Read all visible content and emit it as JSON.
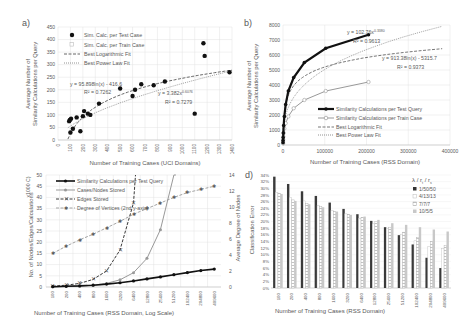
{
  "chart_data": [
    {
      "panel": "a)",
      "type": "scatter",
      "title": "",
      "xlabel": "Number of Training Cases (UCI Domains)",
      "ylabel": "Average Number of Similarity Calculations per Query",
      "xlim": [
        0,
        1400
      ],
      "ylim": [
        0,
        450
      ],
      "x_ticks": [
        "0",
        "100",
        "200",
        "300",
        "400",
        "500",
        "600",
        "700",
        "800",
        "900",
        "1000",
        "1100",
        "1200",
        "1300",
        "1400"
      ],
      "y_ticks": [
        "0",
        "50",
        "100",
        "150",
        "200",
        "250",
        "300",
        "350",
        "400",
        "450"
      ],
      "grid": true,
      "legend": [
        "Sim. Calc. per Test Case",
        "Sim. Calc. per Train Case",
        "Best Logarithmic Fit",
        "Best Power Law Fit"
      ],
      "legend_position": "upper-left",
      "series": [
        {
          "name": "Sim. Calc. per Test Case",
          "points": [
            [
              90,
              75
            ],
            [
              95,
              80
            ],
            [
              105,
              85
            ],
            [
              100,
              30
            ],
            [
              120,
              45
            ],
            [
              150,
              90
            ],
            [
              180,
              35
            ],
            [
              200,
              95
            ],
            [
              210,
              115
            ],
            [
              240,
              105
            ],
            [
              260,
              100
            ],
            [
              330,
              145
            ],
            [
              500,
              205
            ],
            [
              600,
              175
            ],
            [
              620,
              200
            ],
            [
              670,
              222
            ],
            [
              770,
              218
            ],
            [
              860,
              233
            ],
            [
              1100,
              105
            ],
            [
              1170,
              385
            ],
            [
              1180,
              335
            ],
            [
              1380,
              270
            ]
          ]
        },
        {
          "name": "Sim. Calc. per Train Case",
          "points": [
            [
              90,
              72
            ],
            [
              100,
              28
            ],
            [
              110,
              40
            ],
            [
              150,
              88
            ],
            [
              200,
              92
            ]
          ]
        }
      ],
      "fits": [
        {
          "name": "Best Logarithmic Fit",
          "equation": "y = 95.898ln(x) - 416.6",
          "r2": "R² = 0.7262"
        },
        {
          "name": "Best Power Law Fit",
          "equation": "y = 3.382x^0.6076",
          "r2": "R² = 0.7279"
        }
      ]
    },
    {
      "panel": "b)",
      "type": "line",
      "xlabel": "Number of Training Cases (RSS Domain)",
      "ylabel": "Average Number of Similarity Calculations per Query",
      "xlim": [
        0,
        400000
      ],
      "ylim": [
        0,
        8000
      ],
      "x_ticks": [
        "0",
        "100000",
        "200000",
        "300000",
        "400000"
      ],
      "y_ticks": [
        "0",
        "1000",
        "2000",
        "3000",
        "4000",
        "5000",
        "6000",
        "7000",
        "8000"
      ],
      "grid": true,
      "legend": [
        "Similarity Calculations per Test Query",
        "Similarity Calculations per Train Case",
        "Best Logarithmic Fit",
        "Best Power Law Fit"
      ],
      "legend_position": "lower-right",
      "x": [
        100,
        200,
        400,
        800,
        1600,
        3200,
        6400,
        12800,
        25600,
        51200,
        102400,
        204800,
        409600
      ],
      "series": [
        {
          "name": "Similarity Calculations per Test Query",
          "values": [
            150,
            300,
            500,
            800,
            1300,
            1900,
            2700,
            3600,
            4500,
            5500,
            6450,
            7350,
            7350
          ]
        },
        {
          "name": "Similarity Calculations per Train Case",
          "values": [
            100,
            200,
            350,
            550,
            800,
            1100,
            1450,
            1900,
            2450,
            3000,
            3600,
            4200,
            4200
          ]
        }
      ],
      "fits": [
        {
          "name": "Best Power Law Fit",
          "equation": "y = 102.76x^0.3380",
          "r2": "R² = 0.9613"
        },
        {
          "name": "Best Logarithmic Fit",
          "equation": "y = 913.38ln(x) - 5315.7",
          "r2": "R² = 0.9373"
        }
      ]
    },
    {
      "panel": "c)",
      "type": "line",
      "xlabel": "Number of Training Cases (RSS Domain, Log Scale)",
      "ylabel": "No. of Nodes/Edges/Calculations",
      "ylabel_units": "x1000 C)",
      "ylabel_right": "Average Degree of Nodes",
      "categories": [
        "100",
        "200",
        "400",
        "800",
        "1600",
        "3200",
        "6400",
        "12800",
        "25600",
        "51200",
        "102400",
        "204800",
        "409600"
      ],
      "ylim": [
        0,
        50
      ],
      "ylim_right": [
        0,
        14
      ],
      "y_ticks": [
        "0",
        "5",
        "10",
        "15",
        "20",
        "25",
        "30",
        "35",
        "40",
        "45",
        "50"
      ],
      "y_ticks_right": [
        "0",
        "2",
        "4",
        "6",
        "8",
        "10",
        "12",
        "14"
      ],
      "grid": true,
      "legend": [
        "Similarity Calculations per Test Query",
        "Cases/Nodes Stored",
        "Edges Stored",
        "Degree of Vertices (2nd y-axis)"
      ],
      "legend_position": "upper-left",
      "series": [
        {
          "name": "Similarity Calculations per Test Query",
          "axis": "left",
          "values": [
            0.15,
            0.3,
            0.5,
            0.8,
            1.3,
            1.9,
            2.7,
            3.6,
            4.5,
            5.5,
            6.45,
            7.35,
            8.0
          ]
        },
        {
          "name": "Cases/Nodes Stored",
          "axis": "left",
          "values": [
            0.1,
            0.2,
            0.4,
            0.8,
            1.6,
            3.2,
            6.4,
            12.8,
            25.6,
            51.2,
            null,
            null,
            null
          ]
        },
        {
          "name": "Edges Stored",
          "axis": "left",
          "values": [
            0.4,
            0.8,
            1.6,
            3.4,
            7.2,
            16.5,
            37.5,
            null,
            null,
            null,
            null,
            null,
            null
          ]
        },
        {
          "name": "Degree of Vertices (2nd y-axis)",
          "axis": "right",
          "values": [
            4.2,
            5.1,
            5.9,
            6.6,
            7.4,
            8.2,
            9.1,
            9.8,
            10.5,
            11.2,
            11.8,
            12.2,
            12.6
          ]
        }
      ]
    },
    {
      "panel": "d)",
      "type": "bar",
      "xlabel": "Number of Training Cases (RSS Domain)",
      "ylabel": "Classification Error",
      "categories": [
        "100",
        "200",
        "400",
        "800",
        "1600",
        "3200",
        "6400",
        "12800",
        "25600",
        "51200",
        "102400",
        "204800",
        "409600"
      ],
      "ylim": [
        0,
        34
      ],
      "y_ticks": [
        "0%",
        "2%",
        "4%",
        "6%",
        "8%",
        "10%",
        "12%",
        "14%",
        "16%",
        "18%",
        "20%",
        "22%",
        "24%",
        "26%",
        "28%",
        "30%",
        "32%",
        "34%"
      ],
      "legend_title": "λ / r_t / r_s",
      "legend": [
        "1/50/50",
        "4/13/13",
        "7/7/7",
        "10/5/5"
      ],
      "legend_position": "upper-right",
      "series": [
        {
          "name": "1/50/50",
          "values": [
            33.5,
            31.3,
            29.1,
            27.7,
            25.7,
            23.8,
            22.2,
            20.2,
            18.3,
            15.9,
            13.1,
            9.1,
            6.0
          ]
        },
        {
          "name": "4/13/13",
          "values": [
            28.8,
            27.3,
            26.2,
            24.8,
            23.3,
            22.3,
            21.0,
            19.3,
            18.0,
            16.2,
            14.2,
            12.5,
            11.8
          ]
        },
        {
          "name": "7/7/7",
          "values": [
            28.5,
            26.5,
            25.5,
            24.5,
            23.0,
            22.2,
            21.3,
            20.0,
            18.3,
            16.8,
            15.2,
            14.0,
            12.8
          ]
        },
        {
          "name": "10/5/5",
          "values": [
            28.3,
            26.2,
            25.2,
            24.3,
            23.0,
            22.0,
            21.5,
            20.5,
            19.5,
            19.0,
            18.3,
            17.6,
            17.0
          ]
        }
      ]
    }
  ],
  "labels": {
    "a": {
      "panel": "a)",
      "xlabel": "Number of Training Cases (UCI Domains)",
      "ylabel1": "Average Number of",
      "ylabel2": "Similarity Calculations per Query",
      "leg1": "Sim. Calc. per Test Case",
      "leg2": "Sim. Calc. per Train Case",
      "leg3": "Best Logarithmic Fit",
      "leg4": "Best Power Law Fit",
      "eq1": "y = 95.898ln(x) - 416.6",
      "r1": "R² = 0.7262",
      "eq2": "y = 3.382x",
      "eq2exp": "0.6076",
      "r2": "R² = 0.7279"
    },
    "b": {
      "panel": "b)",
      "xlabel": "Number of Training Cases (RSS Domain)",
      "ylabel1": "Average Number of",
      "ylabel2": "Similarity Calculations per Query",
      "leg1": "Similarity Calculations per Test Query",
      "leg2": "Similarity Calculations per Train Case",
      "leg3": "Best Logarithmic Fit",
      "leg4": "Best Power Law Fit",
      "eq1": "y = 102.76x",
      "eq1exp": "0.3380",
      "r1": "R² = 0.9613",
      "eq2": "y = 913.38ln(x) - 5315.7",
      "r2": "R² = 0.9373"
    },
    "c": {
      "xlabel": "Number of Training Cases (RSS Domain, Log Scale)",
      "ylabel": "No. of Nodes/Edges/Calculations",
      "units": "x1000 C)",
      "ylabel_right": "Average Degree of Nodes",
      "leg1": "Similarity Calculations per Test Query",
      "leg2": "Cases/Nodes Stored",
      "leg3": "Edges Stored",
      "leg4": "Degree of Vertices (2nd y-axis)"
    },
    "d": {
      "panel": "d)",
      "xlabel": "Number of Training Cases (RSS Domain)",
      "ylabel": "Classification Error",
      "legend_title": "λ / r",
      "leg1": "1/50/50",
      "leg2": "4/13/13",
      "leg3": "7/7/7",
      "leg4": "10/5/5"
    }
  }
}
